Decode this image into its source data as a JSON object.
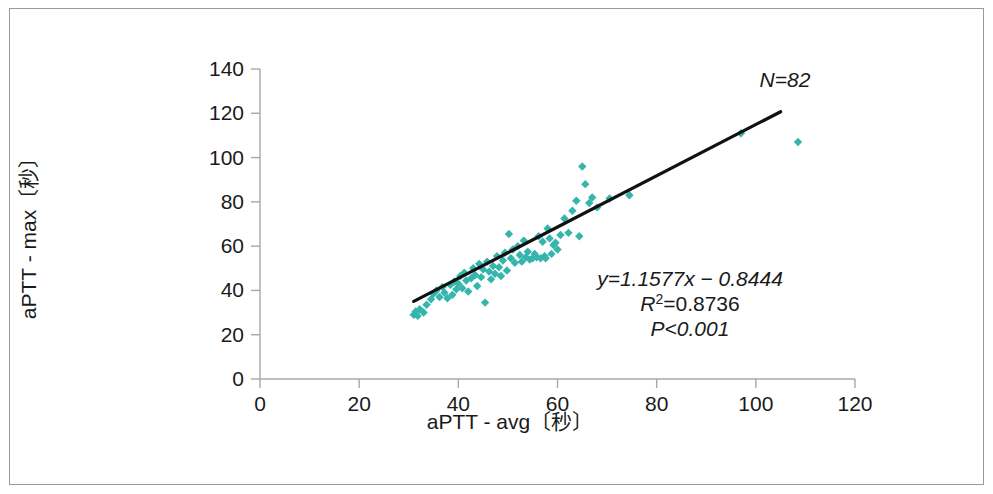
{
  "figure": {
    "background_color": "#ffffff",
    "border_color": "#9a9a9a"
  },
  "chart_data": {
    "type": "scatter",
    "title": "",
    "xlabel": "aPTT - avg〔秒〕",
    "ylabel": "aPTT - max〔秒〕",
    "xlim": [
      0,
      120
    ],
    "ylim": [
      0,
      140
    ],
    "xticks": [
      0,
      20,
      40,
      60,
      80,
      100,
      120
    ],
    "yticks": [
      0,
      20,
      40,
      60,
      80,
      100,
      120,
      140
    ],
    "xtick_labels": [
      "0",
      "20",
      "40",
      "60",
      "80",
      "100",
      "120"
    ],
    "ytick_labels": [
      "0",
      "20",
      "40",
      "60",
      "80",
      "100",
      "120",
      "140"
    ],
    "grid": false,
    "legend": null,
    "marker_color": "#35b5ac",
    "marker_shape": "diamond",
    "marker_size": 6,
    "n_points": 82,
    "points": [
      [
        31.0,
        29.0
      ],
      [
        31.4,
        30.5
      ],
      [
        31.8,
        28.5
      ],
      [
        32.2,
        31.5
      ],
      [
        33.0,
        30.0
      ],
      [
        33.6,
        33.5
      ],
      [
        34.5,
        36.0
      ],
      [
        35.0,
        38.5
      ],
      [
        35.6,
        40.0
      ],
      [
        36.2,
        37.0
      ],
      [
        36.8,
        41.5
      ],
      [
        37.2,
        39.0
      ],
      [
        37.8,
        36.5
      ],
      [
        38.4,
        42.5
      ],
      [
        38.8,
        38.0
      ],
      [
        39.2,
        44.0
      ],
      [
        39.6,
        40.5
      ],
      [
        40.0,
        43.0
      ],
      [
        40.4,
        46.5
      ],
      [
        40.8,
        41.0
      ],
      [
        41.2,
        48.0
      ],
      [
        41.6,
        44.5
      ],
      [
        42.0,
        39.5
      ],
      [
        42.6,
        45.5
      ],
      [
        43.0,
        50.0
      ],
      [
        43.4,
        47.0
      ],
      [
        43.8,
        42.0
      ],
      [
        44.2,
        52.0
      ],
      [
        44.6,
        46.0
      ],
      [
        45.0,
        49.5
      ],
      [
        45.4,
        34.5
      ],
      [
        45.8,
        53.0
      ],
      [
        46.2,
        48.5
      ],
      [
        46.6,
        45.0
      ],
      [
        47.0,
        51.0
      ],
      [
        47.4,
        47.5
      ],
      [
        47.8,
        55.5
      ],
      [
        48.2,
        50.5
      ],
      [
        48.6,
        46.5
      ],
      [
        49.0,
        53.5
      ],
      [
        49.4,
        57.0
      ],
      [
        49.8,
        49.0
      ],
      [
        50.2,
        65.5
      ],
      [
        50.6,
        54.5
      ],
      [
        51.0,
        58.5
      ],
      [
        51.4,
        52.5
      ],
      [
        52.0,
        60.0
      ],
      [
        52.4,
        56.0
      ],
      [
        52.8,
        53.0
      ],
      [
        53.2,
        62.5
      ],
      [
        53.6,
        55.0
      ],
      [
        54.0,
        57.5
      ],
      [
        54.4,
        54.0
      ],
      [
        55.0,
        54.5
      ],
      [
        55.4,
        56.5
      ],
      [
        55.8,
        55.0
      ],
      [
        56.2,
        64.5
      ],
      [
        56.6,
        54.5
      ],
      [
        57.0,
        62.0
      ],
      [
        57.4,
        55.5
      ],
      [
        57.6,
        54.5
      ],
      [
        58.0,
        68.0
      ],
      [
        58.4,
        63.5
      ],
      [
        58.8,
        56.5
      ],
      [
        59.2,
        60.5
      ],
      [
        59.6,
        61.5
      ],
      [
        60.0,
        58.5
      ],
      [
        60.6,
        65.0
      ],
      [
        61.4,
        72.5
      ],
      [
        62.2,
        66.0
      ],
      [
        63.0,
        76.0
      ],
      [
        63.8,
        80.5
      ],
      [
        64.4,
        64.5
      ],
      [
        65.0,
        96.0
      ],
      [
        65.6,
        88.0
      ],
      [
        66.4,
        79.5
      ],
      [
        67.0,
        82.0
      ],
      [
        68.0,
        77.5
      ],
      [
        70.5,
        81.5
      ],
      [
        74.5,
        83.0
      ],
      [
        97.0,
        111.0
      ],
      [
        108.5,
        107.0
      ]
    ],
    "fit_line": {
      "equation": "y=1.1577x − 0.8444",
      "slope": 1.1577,
      "intercept": -0.8444,
      "x_start": 31.0,
      "x_end": 105.0,
      "color": "#111111"
    },
    "annotations": {
      "sample_size": "N=82",
      "equation": "y=1.1577x − 0.8444",
      "r_squared_prefix": "R",
      "r_squared_exponent": "2",
      "r_squared_value": "=0.8736",
      "p_value": "P<0.001"
    }
  }
}
